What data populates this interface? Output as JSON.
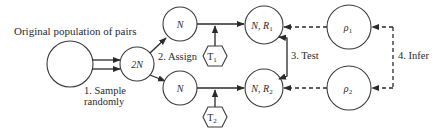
{
  "diagram": {
    "type": "flow-diagram",
    "title": "Original population of pairs",
    "nodes": {
      "population": {
        "label": ""
      },
      "sample": {
        "label": "2N"
      },
      "group1": {
        "label": "N"
      },
      "group2": {
        "label": "N"
      },
      "result1": {
        "label_main": "N, R",
        "label_sub": "1"
      },
      "result2": {
        "label_main": "N, R",
        "label_sub": "2"
      },
      "param1": {
        "label_main": "ρ",
        "label_sub": "1"
      },
      "param2": {
        "label_main": "ρ",
        "label_sub": "2"
      },
      "treatment1": {
        "label_main": "T",
        "label_sub": "1"
      },
      "treatment2": {
        "label_main": "T",
        "label_sub": "2"
      }
    },
    "steps": {
      "step1_line1": "1. Sample",
      "step1_line2": "randomly",
      "step2": "2. Assign",
      "step3": "3. Test",
      "step4": "4. Infer"
    },
    "colors": {
      "stroke": "#2a2a2a",
      "background": "#ffffff"
    }
  }
}
